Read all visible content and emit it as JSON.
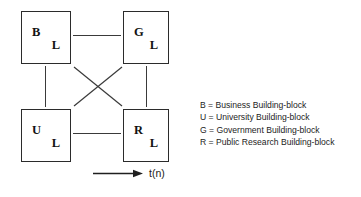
{
  "figure": {
    "background_color": "#ffffff",
    "line_color": "#3a3a3a",
    "box_border_color": "#2b2b2b",
    "text_color": "#1a1a1a"
  },
  "nodes": [
    {
      "id": "business",
      "primary": "B",
      "secondary": "L",
      "position": "top-left"
    },
    {
      "id": "government",
      "primary": "G",
      "secondary": "L",
      "position": "top-right"
    },
    {
      "id": "university",
      "primary": "U",
      "secondary": "L",
      "position": "bottom-left"
    },
    {
      "id": "public-research",
      "primary": "R",
      "secondary": "L",
      "position": "bottom-right"
    }
  ],
  "axis": {
    "label": "t(n)",
    "arrow_direction": "right"
  },
  "legend": {
    "entries": [
      {
        "key": "B",
        "text": "B = Business Building-block"
      },
      {
        "key": "U",
        "text": "U = University Building-block"
      },
      {
        "key": "G",
        "text": "G = Government Building-block"
      },
      {
        "key": "R",
        "text": "R = Public Research Building-block"
      }
    ]
  }
}
